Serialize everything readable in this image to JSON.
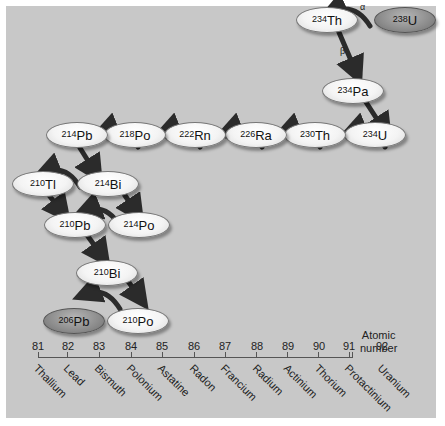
{
  "colors": {
    "panel": "#c8c8c8",
    "node_light": "#f4f4f4",
    "node_dark": "#8c8c8c",
    "arrow": "#2b2b2b"
  },
  "nodes": [
    {
      "id": "U238",
      "mass": "238",
      "symbol": "U",
      "dark": true
    },
    {
      "id": "Th234",
      "mass": "234",
      "symbol": "Th"
    },
    {
      "id": "Pa234",
      "mass": "234",
      "symbol": "Pa"
    },
    {
      "id": "U234",
      "mass": "234",
      "symbol": "U"
    },
    {
      "id": "Th230",
      "mass": "230",
      "symbol": "Th"
    },
    {
      "id": "Ra226",
      "mass": "226",
      "symbol": "Ra"
    },
    {
      "id": "Rn222",
      "mass": "222",
      "symbol": "Rn"
    },
    {
      "id": "Po218",
      "mass": "218",
      "symbol": "Po"
    },
    {
      "id": "Pb214",
      "mass": "214",
      "symbol": "Pb"
    },
    {
      "id": "Bi214",
      "mass": "214",
      "symbol": "Bi"
    },
    {
      "id": "Tl210",
      "mass": "210",
      "symbol": "Tl"
    },
    {
      "id": "Po214",
      "mass": "214",
      "symbol": "Po"
    },
    {
      "id": "Pb210",
      "mass": "210",
      "symbol": "Pb"
    },
    {
      "id": "Bi210",
      "mass": "210",
      "symbol": "Bi"
    },
    {
      "id": "Po210",
      "mass": "210",
      "symbol": "Po"
    },
    {
      "id": "Pb206",
      "mass": "206",
      "symbol": "Pb",
      "dark": true
    }
  ],
  "arrow_labels": {
    "alpha": "α",
    "beta": "β"
  },
  "axis": {
    "title_line1": "Atomic",
    "title_line2": "number",
    "numbers": [
      "81",
      "82",
      "83",
      "84",
      "85",
      "86",
      "87",
      "88",
      "89",
      "90",
      "91",
      "92"
    ],
    "elements": [
      "Thallium",
      "Lead",
      "Bismuth",
      "Polonium",
      "Astatine",
      "Radon",
      "Francium",
      "Radium",
      "Actinium",
      "Thorium",
      "Protactinium",
      "Uranium"
    ]
  }
}
